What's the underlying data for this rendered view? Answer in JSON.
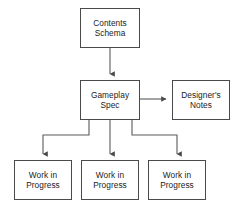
{
  "diagram": {
    "type": "flowchart",
    "background_color": "#ffffff",
    "box_border_color": "#4a4a4a",
    "box_fill_color": "#ffffff",
    "connector_color": "#5a5a5a",
    "text_color": "#1b1b1b",
    "nodes": [
      {
        "id": "contents-schema",
        "line1": "Contents",
        "line2": "Schema",
        "x": 80,
        "y": 8,
        "w": 60,
        "h": 40
      },
      {
        "id": "gameplay-spec",
        "line1": "Gameplay",
        "line2": "Spec",
        "x": 80,
        "y": 80,
        "w": 60,
        "h": 40
      },
      {
        "id": "designers-notes",
        "line1": "Designer's",
        "line2": "Notes",
        "x": 172,
        "y": 80,
        "w": 58,
        "h": 40
      },
      {
        "id": "work-in-progress-1",
        "line1": "Work in",
        "line2": "Progress",
        "x": 14,
        "y": 160,
        "w": 58,
        "h": 40
      },
      {
        "id": "work-in-progress-2",
        "line1": "Work in",
        "line2": "Progress",
        "x": 81,
        "y": 160,
        "w": 58,
        "h": 40
      },
      {
        "id": "work-in-progress-3",
        "line1": "Work in",
        "line2": "Progress",
        "x": 148,
        "y": 160,
        "w": 58,
        "h": 40
      }
    ],
    "connectors": [
      {
        "id": "contents-to-gameplay",
        "from": "contents-schema",
        "to": "gameplay-spec",
        "path": "M110,48 L110,76",
        "arrow": "down"
      },
      {
        "id": "gameplay-to-notes",
        "from": "gameplay-spec",
        "to": "designers-notes",
        "path": "M140,99 L168,99",
        "arrow": "right"
      },
      {
        "id": "gameplay-to-wip1",
        "from": "gameplay-spec",
        "to": "work-in-progress-1",
        "path": "M89,120 L89,135 L43,135 L43,156",
        "arrow": "down"
      },
      {
        "id": "gameplay-to-wip2",
        "from": "gameplay-spec",
        "to": "work-in-progress-2",
        "path": "M110,120 L110,156",
        "arrow": "down"
      },
      {
        "id": "gameplay-to-wip3",
        "from": "gameplay-spec",
        "to": "work-in-progress-3",
        "path": "M132,120 L132,135 L177,135 L177,156",
        "arrow": "down"
      }
    ]
  }
}
